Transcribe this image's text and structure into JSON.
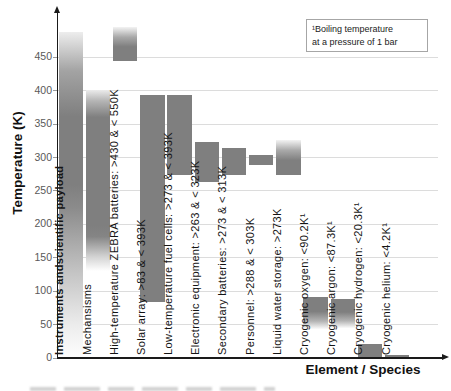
{
  "footnote": {
    "line1": "¹Boiling temperature",
    "line2": "at a pressure of 1 bar"
  },
  "chart_data": {
    "type": "bar",
    "subtype": "vertical-range-bars",
    "title": "",
    "xlabel": "Element / Species",
    "ylabel": "Temperature (K)",
    "units": "K",
    "ylim": [
      0,
      505
    ],
    "y_ticks": [
      0,
      50,
      100,
      150,
      200,
      250,
      300,
      350,
      400,
      450
    ],
    "grid": true,
    "bar_color": "#7f7f7f",
    "footnote": "¹Boiling temperature at a pressure of 1 bar",
    "categories": [
      {
        "label": "Instruments andscientific payload",
        "bold": true,
        "draw_min": 0,
        "draw_max": 487,
        "fade": "both-tall"
      },
      {
        "label": "Mechansisms",
        "bold": false,
        "draw_min": 130,
        "draw_max": 400,
        "fade": "both-mid"
      },
      {
        "label": "High-temperature ZEBRA batteries: >430 & < 550K",
        "bold": false,
        "min_K": 430,
        "max_K": 550,
        "draw_min": 444,
        "draw_max": 494,
        "fade": "top"
      },
      {
        "label": "Solar array: >83 & < 393K",
        "bold": false,
        "min_K": 83,
        "max_K": 393,
        "draw_min": 83,
        "draw_max": 393,
        "fade": "none"
      },
      {
        "label": "Low-temperature fuel cells: >273 & < 393K",
        "bold": false,
        "min_K": 273,
        "max_K": 393,
        "draw_min": 273,
        "draw_max": 393,
        "fade": "none"
      },
      {
        "label": "Electronic equipment: >263 & < 323K",
        "bold": false,
        "min_K": 263,
        "max_K": 323,
        "draw_min": 263,
        "draw_max": 323,
        "fade": "none"
      },
      {
        "label": "Secondary batteries: >273 & < 313K",
        "bold": false,
        "min_K": 273,
        "max_K": 313,
        "draw_min": 273,
        "draw_max": 313,
        "fade": "none"
      },
      {
        "label": "Personnel: >288 & < 303K",
        "bold": false,
        "min_K": 288,
        "max_K": 303,
        "draw_min": 288,
        "draw_max": 303,
        "fade": "none"
      },
      {
        "label": "Liquid water storage: >273K",
        "bold": false,
        "min_K": 273,
        "draw_min": 273,
        "draw_max": 325,
        "fade": "top"
      },
      {
        "label": "Cryogenic oxygen: <90.2K¹",
        "bold": false,
        "max_K": 90.2,
        "draw_min": 42,
        "draw_max": 90,
        "fade": "bottom"
      },
      {
        "label": "Cryogenic argon: <87.3K¹",
        "bold": false,
        "max_K": 87.3,
        "draw_min": 44,
        "draw_max": 87,
        "fade": "bottom"
      },
      {
        "label": "Cryogenic hydrogen: <20.3K¹",
        "bold": false,
        "max_K": 20.3,
        "draw_min": 0,
        "draw_max": 20.3,
        "fade": "none"
      },
      {
        "label": "Cryogenic helium: <4.2K¹",
        "bold": false,
        "max_K": 4.2,
        "draw_min": 0,
        "draw_max": 4.2,
        "fade": "none"
      }
    ]
  }
}
